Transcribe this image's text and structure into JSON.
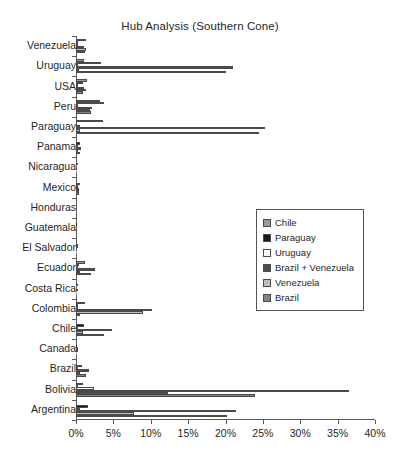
{
  "chart_data": {
    "type": "bar",
    "orientation": "horizontal",
    "title": "Hub Analysis (Southern Cone)",
    "xlabel": "",
    "ylabel": "",
    "xlim": [
      0,
      40
    ],
    "xtick_labels": [
      "0%",
      "5%",
      "10%",
      "15%",
      "20%",
      "25%",
      "30%",
      "35%",
      "40%"
    ],
    "xtick_values": [
      0,
      5,
      10,
      15,
      20,
      25,
      30,
      35,
      40
    ],
    "grid": false,
    "legend_position": "center-right",
    "categories": [
      "Venezuela",
      "Uruguay",
      "USA",
      "Peru",
      "Paraguay",
      "Panama",
      "Nicaragua",
      "Mexico",
      "Honduras",
      "Guatemala",
      "El Salvador",
      "Ecuador",
      "Costa Rica",
      "Colombia",
      "Chile",
      "Canada",
      "Brazil",
      "Bolivia",
      "Argentina"
    ],
    "series": [
      {
        "name": "Chile",
        "color": "#9a9a9a",
        "values": [
          1.3,
          1.1,
          1.5,
          3.2,
          3.6,
          0.0,
          0.0,
          0.0,
          0.0,
          0.0,
          0.0,
          1.2,
          0.0,
          1.2,
          0.0,
          0.0,
          0.0,
          1.0,
          0.0
        ]
      },
      {
        "name": "Paraguay",
        "color": "#1a1a1a",
        "values": [
          0.3,
          3.4,
          1.0,
          3.7,
          0.0,
          0.6,
          0.2,
          0.5,
          0.0,
          0.1,
          0.2,
          0.4,
          0.2,
          0.2,
          1.1,
          0.1,
          0.8,
          0.2,
          1.6
        ]
      },
      {
        "name": "Uruguay",
        "color": "#ffffff",
        "values": [
          0.2,
          0.2,
          0.2,
          0.2,
          0.6,
          0.2,
          0.1,
          0.3,
          0.0,
          0.1,
          0.3,
          0.2,
          0.1,
          0.2,
          0.3,
          0.2,
          0.3,
          2.4,
          0.5
        ]
      },
      {
        "name": "Brazil + Venezuela",
        "color": "#4d4d4d",
        "values": [
          1.1,
          21.0,
          1.1,
          2.1,
          25.3,
          0.7,
          0.0,
          0.4,
          0.0,
          0.0,
          0.0,
          2.5,
          0.2,
          10.1,
          4.8,
          0.2,
          1.8,
          36.5,
          21.4
        ]
      },
      {
        "name": "Venezuela",
        "color": "#bdbdbd",
        "values": [
          1.4,
          0.4,
          1.3,
          1.9,
          0.5,
          0.3,
          0.1,
          0.4,
          0.0,
          0.0,
          0.1,
          0.5,
          0.1,
          9.0,
          1.0,
          0.1,
          0.5,
          12.3,
          7.7
        ]
      },
      {
        "name": "Brazil",
        "color": "#828282",
        "values": [
          1.2,
          20.1,
          0.9,
          2.0,
          24.5,
          0.5,
          0.1,
          0.4,
          0.0,
          0.0,
          0.1,
          2.0,
          0.1,
          0.6,
          3.7,
          0.1,
          1.4,
          23.9,
          20.2
        ]
      }
    ]
  }
}
